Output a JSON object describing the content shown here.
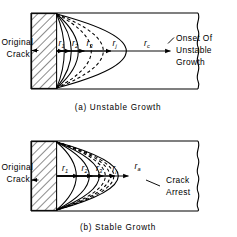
{
  "figure": {
    "type": "engineering-diagram",
    "background": "#ffffff",
    "line_color": "#000000"
  },
  "panels": [
    {
      "id": "a",
      "caption": "(a) Unstable Growth",
      "left_callout": {
        "line1": "Original",
        "line2": "Crack"
      },
      "right_callout": {
        "line1": "Onset Of",
        "line2": "Unstable",
        "line3": "Growth"
      },
      "radii": [
        {
          "base": "r",
          "sub": "1"
        },
        {
          "base": "r",
          "sub": "2"
        },
        {
          "base": "r",
          "sub": "3"
        },
        {
          "base": "r",
          "sub": "j"
        },
        {
          "base": "r",
          "sub": "c"
        }
      ],
      "solid_fronts": 3,
      "dashed_fronts": 2,
      "final_front_style": "solid"
    },
    {
      "id": "b",
      "caption": "(b) Stable Growth",
      "left_callout": {
        "line1": "Original",
        "line2": "Crack"
      },
      "right_callout": {
        "line1": "Crack",
        "line2": "Arrest"
      },
      "radii": [
        {
          "base": "r",
          "sub": "1"
        },
        {
          "base": "r",
          "sub": "2"
        },
        {
          "base": "r",
          "sub": "3"
        },
        {
          "base": "r",
          "sub": "j"
        },
        {
          "base": "r",
          "sub": "a"
        }
      ],
      "solid_fronts": 3,
      "dashed_fronts": 3,
      "final_front_style": "solid"
    }
  ],
  "labels": {
    "panel_a_caption": "(a) Unstable Growth",
    "panel_b_caption": "(b) Stable Growth",
    "original": "Original",
    "crack": "Crack",
    "onset_of": "Onset Of",
    "unstable": "Unstable",
    "growth": "Growth",
    "crack_word": "Crack",
    "arrest": "Arrest",
    "r": "r",
    "sub1": "1",
    "sub2": "2",
    "sub3": "3",
    "subj": "j",
    "subc": "c",
    "suba": "a"
  }
}
